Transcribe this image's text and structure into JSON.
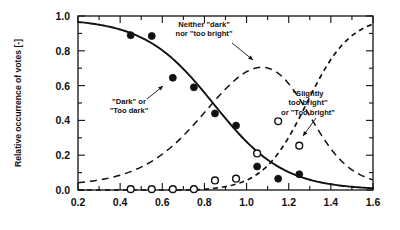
{
  "chart_data": {
    "type": "scatter",
    "title": "",
    "xlabel": "",
    "ylabel": "Relative occurrence of votes [-]",
    "xlim": [
      0.2,
      1.6
    ],
    "ylim": [
      0.0,
      1.0
    ],
    "grid": false,
    "legend_position": "none",
    "x_ticks": [
      "0.2",
      "0.4",
      "0.6",
      "0.8",
      "1.0",
      "1.2",
      "1.4",
      "1.6"
    ],
    "x_tick_values": [
      0.2,
      0.4,
      0.6,
      0.8,
      1.0,
      1.2,
      1.4,
      1.6
    ],
    "x_minor_step": 0.1,
    "y_ticks": [
      "0.0",
      "0.2",
      "0.4",
      "0.6",
      "0.8",
      "1.0"
    ],
    "y_tick_values": [
      0.0,
      0.2,
      0.4,
      0.6,
      0.8,
      1.0
    ],
    "y_minor_step": 0.1,
    "series": [
      {
        "name": "\"Dark\" or \"Too dark\"",
        "marker": "filled-circle",
        "line": "solid",
        "x": [
          0.45,
          0.55,
          0.65,
          0.75,
          0.85,
          0.95,
          1.05,
          1.15,
          1.25
        ],
        "values": [
          0.89,
          0.885,
          0.645,
          0.59,
          0.44,
          0.37,
          0.135,
          0.065,
          0.09
        ]
      },
      {
        "name": "Neither \"dark\" nor \"too bright\"",
        "marker": "none",
        "line": "dashed",
        "x": [
          0.2,
          0.3,
          0.4,
          0.5,
          0.6,
          0.7,
          0.8,
          0.9,
          1.0,
          1.05,
          1.1,
          1.2,
          1.3,
          1.4,
          1.5,
          1.6
        ],
        "values": [
          0.025,
          0.045,
          0.08,
          0.135,
          0.23,
          0.37,
          0.54,
          0.69,
          0.765,
          0.755,
          0.72,
          0.58,
          0.38,
          0.2,
          0.09,
          0.03
        ]
      },
      {
        "name": "\"Slightly too bright\" or \"Too bright\"",
        "marker": "open-circle",
        "line": "dashed",
        "x": [
          0.45,
          0.55,
          0.65,
          0.75,
          0.85,
          0.95,
          1.05,
          1.15,
          1.25
        ],
        "values": [
          0.005,
          0.005,
          0.005,
          0.005,
          0.055,
          0.065,
          0.21,
          0.395,
          0.255
        ]
      }
    ],
    "annotations": [
      {
        "name": "neither-dark-nor-too-bright",
        "lines": [
          "Neither \"dark\"",
          "nor \"too bright\""
        ],
        "text_x": 204,
        "text_y": 27,
        "align": "middle",
        "leader": [
          [
            232,
            43
          ],
          [
            253,
            60
          ]
        ]
      },
      {
        "name": "dark-or-too-dark",
        "lines": [
          "\"Dark\" or",
          "\"Too dark\""
        ],
        "text_x": 129,
        "text_y": 104,
        "align": "middle",
        "leader": [
          [
            147,
            99
          ],
          [
            163,
            86
          ]
        ]
      },
      {
        "name": "slightly-too-bright-or-too-bright",
        "lines": [
          "\"Slightly",
          "too bright\"",
          "or \"Too bright\""
        ],
        "text_x": 308,
        "text_y": 96,
        "align": "middle",
        "leader": [
          [
            316,
            118
          ],
          [
            303,
            136
          ]
        ]
      }
    ]
  },
  "colors": {
    "axis": "#111111",
    "curve": "#111111",
    "marker_fill": "#111111",
    "marker_open_fill": "#ffffff",
    "background": "#ffffff"
  }
}
